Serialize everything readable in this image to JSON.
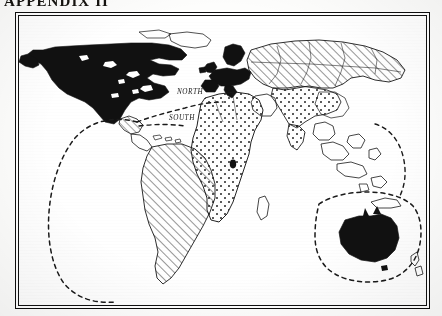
{
  "document": {
    "title": "APPENDIX II",
    "title_clipped": true
  },
  "figure": {
    "caption": "",
    "frame": "double-rule-black"
  },
  "map": {
    "labels": [
      {
        "text": "NORTH",
        "x": 172,
        "y": 84
      },
      {
        "text": "SOUTH",
        "x": 168,
        "y": 110
      }
    ],
    "legend_note": "",
    "regions": [
      {
        "name": "North America",
        "fill": "solid-black"
      },
      {
        "name": "Greenland",
        "fill": "solid-black"
      },
      {
        "name": "Central America",
        "fill": "diagonal-hatch"
      },
      {
        "name": "South America",
        "fill": "diagonal-hatch"
      },
      {
        "name": "Western Europe",
        "fill": "solid-black"
      },
      {
        "name": "Scandinavia",
        "fill": "solid-black"
      },
      {
        "name": "Africa",
        "fill": "dotted-stipple"
      },
      {
        "name": "Northern Asia",
        "fill": "diagonal-hatch"
      },
      {
        "name": "Southern Asia",
        "fill": "dotted-stipple"
      },
      {
        "name": "Southeast Asia",
        "fill": "outline-only"
      },
      {
        "name": "Australia",
        "fill": "solid-black"
      },
      {
        "name": "New Zealand",
        "fill": "outline-only"
      }
    ],
    "boundaries": [
      {
        "name": "Americas boundary",
        "style": "dashed"
      },
      {
        "name": "Oceania boundary",
        "style": "dashed"
      },
      {
        "name": "North-South divide",
        "style": "dashed"
      }
    ]
  },
  "colors": {
    "ink": "#111111",
    "paper": "#ffffff",
    "page": "#fdfdfc"
  }
}
